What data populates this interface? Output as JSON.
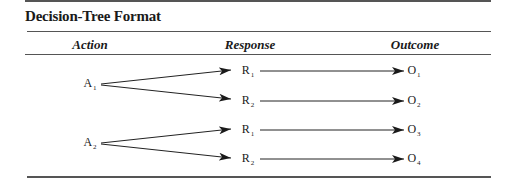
{
  "title": "Decision-Tree Format",
  "columns": {
    "action": "Action",
    "response": "Response",
    "outcome": "Outcome"
  },
  "actions": [
    {
      "letter": "A",
      "sub": "1",
      "responses": [
        {
          "letter": "R",
          "sub": "1",
          "outcome": {
            "letter": "O",
            "sub": "1"
          }
        },
        {
          "letter": "R",
          "sub": "2",
          "outcome": {
            "letter": "O",
            "sub": "2"
          }
        }
      ]
    },
    {
      "letter": "A",
      "sub": "2",
      "responses": [
        {
          "letter": "R",
          "sub": "1",
          "outcome": {
            "letter": "O",
            "sub": "3"
          }
        },
        {
          "letter": "R",
          "sub": "2",
          "outcome": {
            "letter": "O",
            "sub": "4"
          }
        }
      ]
    }
  ]
}
